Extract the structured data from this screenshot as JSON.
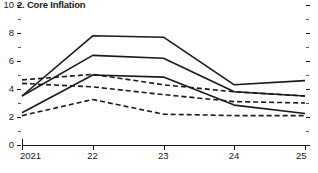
{
  "chart_data": {
    "type": "line",
    "title": "2. Core Inflation",
    "xlabel": "",
    "ylabel": "",
    "x": [
      "2021",
      "22",
      "23",
      "24",
      "25"
    ],
    "xtick_labels": [
      "2021",
      "22",
      "23",
      "24",
      "25"
    ],
    "ytick_labels": [
      "0",
      "2",
      "4",
      "6",
      "8",
      "10"
    ],
    "ytick_values": [
      0,
      2,
      4,
      6,
      8,
      10
    ],
    "yminor_values": [
      1,
      3,
      5,
      7,
      9
    ],
    "ylim": [
      0,
      10
    ],
    "grid": false,
    "legend": "none",
    "right_axis_ticks": true,
    "series": [
      {
        "name": "solid-upper",
        "style": "solid",
        "color": "#1a1a1a",
        "values": [
          3.5,
          7.8,
          7.7,
          4.3,
          4.6
        ]
      },
      {
        "name": "solid-middle",
        "style": "solid",
        "color": "#1a1a1a",
        "values": [
          3.5,
          6.4,
          6.2,
          3.8,
          3.5
        ]
      },
      {
        "name": "solid-lower",
        "style": "solid",
        "color": "#1a1a1a",
        "values": [
          2.3,
          5.0,
          4.85,
          2.85,
          2.25
        ]
      },
      {
        "name": "dashed-upper",
        "style": "dashed",
        "color": "#1a1a1a",
        "values": [
          4.65,
          5.05,
          4.3,
          3.8,
          3.5
        ]
      },
      {
        "name": "dashed-middle",
        "style": "dashed",
        "color": "#1a1a1a",
        "values": [
          4.4,
          4.15,
          3.6,
          3.1,
          3.0
        ]
      },
      {
        "name": "dashed-lower",
        "style": "dashed",
        "color": "#1a1a1a",
        "values": [
          2.1,
          3.25,
          2.2,
          2.1,
          2.1
        ]
      }
    ]
  }
}
